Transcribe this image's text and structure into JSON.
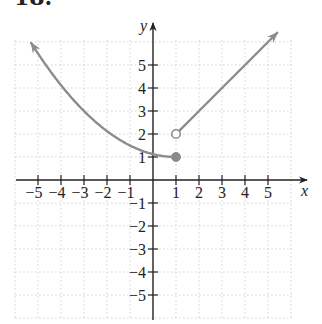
{
  "title": "18.",
  "chart_data": {
    "type": "line",
    "title": "18.",
    "xlabel": "x",
    "ylabel": "y",
    "xlim": [
      -6,
      6
    ],
    "ylim": [
      -6,
      6
    ],
    "grid": true,
    "x_ticks": [
      -5,
      -4,
      -3,
      -2,
      -1,
      1,
      2,
      3,
      4,
      5
    ],
    "y_ticks": [
      -5,
      -4,
      -3,
      -2,
      -1,
      1,
      2,
      3,
      4,
      5
    ],
    "x_tick_labels": [
      "−5",
      "−4",
      "−3",
      "−2",
      "−1",
      "1",
      "2",
      "3",
      "4",
      "5"
    ],
    "y_tick_labels": [
      "−5",
      "−4",
      "−3",
      "−2",
      "−1",
      "1",
      "2",
      "3",
      "4",
      "5"
    ],
    "series": [
      {
        "name": "left piece",
        "description": "f(x) = (x-1)^2/8 + 1 for x <= 1",
        "x": [
          -5.3,
          -5,
          -4,
          -3,
          -2,
          -1,
          0,
          1
        ],
        "y": [
          5.96,
          5.5,
          4.125,
          3,
          2.125,
          1.5,
          1.125,
          1
        ],
        "start_arrow": true,
        "end_point": {
          "x": 1,
          "y": 1,
          "style": "closed"
        }
      },
      {
        "name": "right piece",
        "description": "f(x) = x + 1 for x > 1",
        "x": [
          1,
          2,
          3,
          4,
          5,
          5.4
        ],
        "y": [
          2,
          3,
          4,
          5,
          6,
          6.4
        ],
        "start_point": {
          "x": 1,
          "y": 2,
          "style": "open"
        },
        "end_arrow": true
      }
    ],
    "colors": {
      "curve": "#8c8c8c",
      "axis": "#222222",
      "grid": "#c8c8c8"
    }
  }
}
